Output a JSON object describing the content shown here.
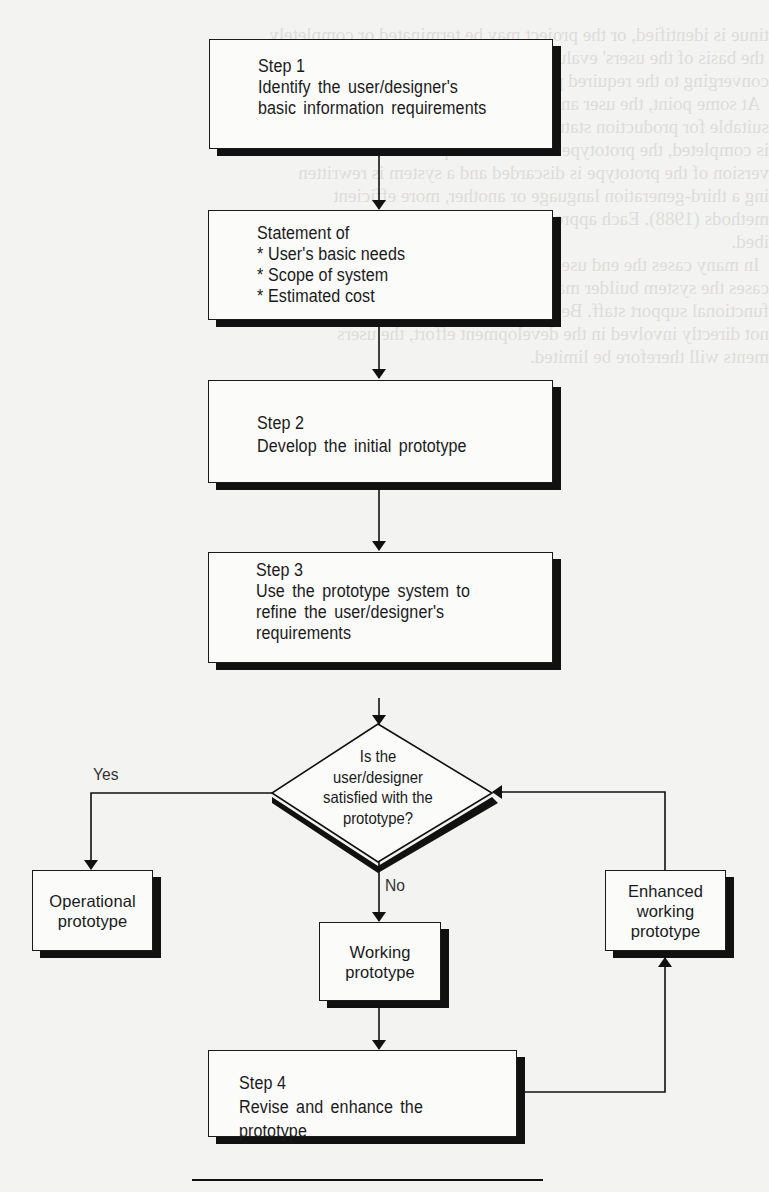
{
  "diagram": {
    "steps": [
      {
        "id": "step1",
        "lines": [
          "Step 1",
          "Identify the user/designer's",
          "basic information requirements"
        ]
      },
      {
        "id": "statement",
        "lines": [
          "Statement of",
          "* User's basic needs",
          "* Scope of system",
          "* Estimated cost"
        ]
      },
      {
        "id": "step2",
        "lines": [
          "Step 2",
          "Develop the initial prototype"
        ]
      },
      {
        "id": "step3",
        "lines": [
          "Step 3",
          "Use the prototype system to",
          "refine the user/designer's",
          "requirements"
        ]
      },
      {
        "id": "step4",
        "lines": [
          "Step 4",
          "Revise and enhance the prototype"
        ]
      }
    ],
    "decision": {
      "lines": [
        "Is the",
        "user/designer",
        "satisfied with the",
        "prototype?"
      ]
    },
    "branches": {
      "yes_label": "Yes",
      "no_label": "No"
    },
    "outcomes": {
      "operational": {
        "lines": [
          "Operational",
          "prototype"
        ]
      },
      "working": {
        "lines": [
          "Working",
          "prototype"
        ]
      },
      "enhanced": {
        "lines": [
          "Enhanced",
          "working",
          "prototype"
        ]
      }
    }
  }
}
